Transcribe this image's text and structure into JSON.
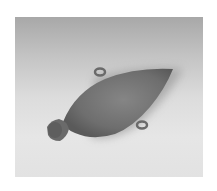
{
  "image": {
    "subject": "ceramic pear-shaped vessel with lug handles",
    "alt": "Photograph of an ancient pottery vessel lying on its side against a gradient backdrop",
    "colors": {
      "background": "#ffffff",
      "backdrop_top": "#a8a8a8",
      "backdrop_bottom": "#e4e4e4",
      "vessel_body": "#7a7a7a",
      "vessel_shadow": "#5a5a5a",
      "neck": "#6a6a6a"
    }
  }
}
